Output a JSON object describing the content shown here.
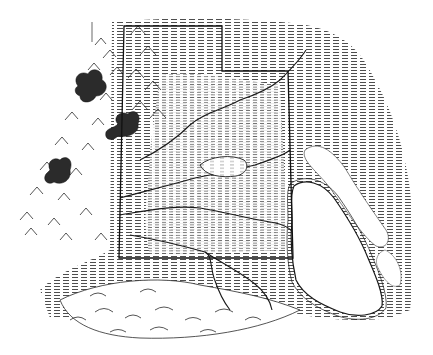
{
  "figure": {
    "type": "engraved relief map illustration",
    "style": "black ink hatching on white",
    "caption_fragment": "",
    "colors": {
      "ink": "#1a1a1a",
      "hatch": "#555555",
      "paper": "#ffffff",
      "lake": "#ffffff"
    }
  },
  "map": {
    "boundary": {
      "shape": "state outline with notched top-right corner",
      "points": [
        [
          124,
          26
        ],
        [
          222,
          26
        ],
        [
          222,
          71
        ],
        [
          288,
          71
        ],
        [
          293,
          258
        ],
        [
          119,
          258
        ]
      ]
    },
    "features": [
      {
        "name": "lake",
        "kind": "large lake at right, elongated, tilted"
      },
      {
        "name": "mountain-range-west",
        "kind": "hatched peaks along left side"
      },
      {
        "name": "dark-peaks",
        "kind": "three shaded summit clusters at left"
      },
      {
        "name": "rivers",
        "kind": "meandering channels crossing the plain"
      },
      {
        "name": "basin",
        "kind": "oval depression in center"
      },
      {
        "name": "southern-hills",
        "kind": "rolling ridges below boundary"
      }
    ]
  }
}
